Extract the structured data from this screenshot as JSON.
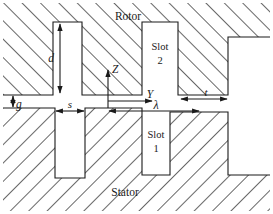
{
  "figure": {
    "type": "cross-section-diagram",
    "background_color": "#ffffff",
    "line_color": "#1a1a1a",
    "hatch_color": "#555555"
  },
  "labels": {
    "rotor": "Rotor",
    "stator": "Stator",
    "slot2": "Slot",
    "slot2_num": "2",
    "slot1": "Slot",
    "slot1_num": "1",
    "axis_z": "Z",
    "axis_y": "Y",
    "dim_d": "d",
    "dim_g": "g",
    "dim_s": "s",
    "dim_t": "t",
    "dim_lambda": "λ"
  },
  "dimensions": {
    "d": {
      "symbol": "d",
      "meaning": "rotor slot depth",
      "orientation": "vertical"
    },
    "g": {
      "symbol": "g",
      "meaning": "air gap",
      "orientation": "vertical"
    },
    "s": {
      "symbol": "s",
      "meaning": "stator slot width",
      "orientation": "horizontal"
    },
    "t": {
      "symbol": "t",
      "meaning": "tooth width",
      "orientation": "horizontal"
    },
    "lambda": {
      "symbol": "λ",
      "meaning": "slot pitch",
      "orientation": "horizontal"
    }
  },
  "axes": {
    "origin_label": "Y",
    "vertical_label": "Z",
    "z_direction": "up",
    "y_direction": "right"
  },
  "geometry": {
    "canvas": {
      "width": 273,
      "height": 214
    },
    "rotor": {
      "top": 3,
      "bottom": 95,
      "left": 3,
      "right": 270,
      "hatch_direction": "forward-slash",
      "slots": [
        {
          "name": "rotor-slot-left",
          "x1": 53,
          "x2": 82,
          "y1": 22,
          "y2": 95
        },
        {
          "name": "rotor-slot-2",
          "x1": 142,
          "x2": 178,
          "y1": 22,
          "y2": 95
        },
        {
          "name": "rotor-slot-right",
          "x1": 228,
          "x2": 270,
          "y1": 37,
          "y2": 95
        }
      ]
    },
    "stator": {
      "top": 108,
      "bottom": 211,
      "left": 3,
      "right": 270,
      "hatch_direction": "back-slash",
      "slots": [
        {
          "name": "stator-slot-left",
          "x1": 55,
          "x2": 85,
          "y1": 108,
          "y2": 178
        },
        {
          "name": "stator-slot-1",
          "x1": 142,
          "x2": 170,
          "y1": 112,
          "y2": 175
        },
        {
          "name": "stator-slot-right",
          "x1": 228,
          "x2": 270,
          "y1": 112,
          "y2": 175
        }
      ]
    },
    "air_gap": {
      "y_top": 95,
      "y_bottom": 108
    }
  }
}
